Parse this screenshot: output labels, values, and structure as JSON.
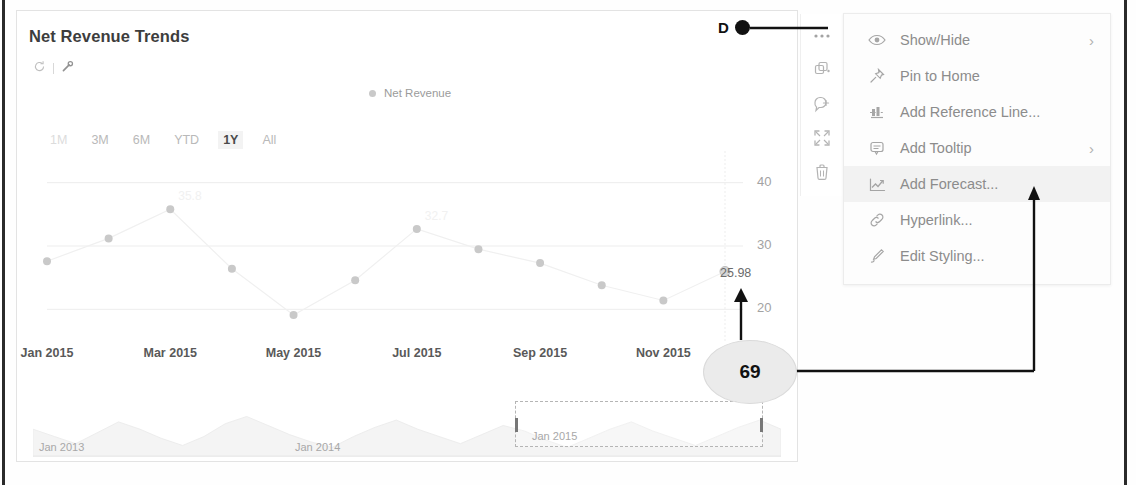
{
  "card": {
    "title": "Net Revenue Trends",
    "header_icons": [
      {
        "name": "refresh-icon",
        "label": "Refresh"
      },
      {
        "name": "wrench-icon",
        "label": "Configure"
      }
    ],
    "legend": [
      {
        "label": "Net Revenue",
        "color": "#c9c9c9"
      }
    ],
    "range_buttons": [
      {
        "label": "1M",
        "selected": false,
        "dim": true
      },
      {
        "label": "3M",
        "selected": false,
        "dim": false
      },
      {
        "label": "6M",
        "selected": false,
        "dim": false
      },
      {
        "label": "YTD",
        "selected": false,
        "dim": false
      },
      {
        "label": "1Y",
        "selected": true,
        "dim": false
      },
      {
        "label": "All",
        "selected": false,
        "dim": false
      }
    ],
    "point_label": "25.98"
  },
  "navigator": {
    "labels": [
      "Jan 2013",
      "Jan 2014",
      "Jan 2015"
    ],
    "selection_start_label": "Jan 2015"
  },
  "tool_strip": [
    {
      "name": "more-options-icon",
      "label": "More options"
    },
    {
      "name": "duplicate-icon",
      "label": "Duplicate"
    },
    {
      "name": "add-comment-icon",
      "label": "Add comment"
    },
    {
      "name": "expand-icon",
      "label": "Expand"
    },
    {
      "name": "delete-icon",
      "label": "Delete"
    }
  ],
  "context_menu": {
    "items": [
      {
        "label": "Show/Hide",
        "icon": "eye-icon",
        "submenu": true,
        "highlight": false
      },
      {
        "label": "Pin to Home",
        "icon": "pin-icon",
        "submenu": false,
        "highlight": false
      },
      {
        "label": "Add Reference Line...",
        "icon": "reference-line-icon",
        "submenu": false,
        "highlight": false
      },
      {
        "label": "Add Tooltip",
        "icon": "tooltip-icon",
        "submenu": true,
        "highlight": false
      },
      {
        "label": "Add Forecast...",
        "icon": "forecast-chart-icon",
        "submenu": false,
        "highlight": true
      },
      {
        "label": "Hyperlink...",
        "icon": "link-icon",
        "submenu": false,
        "highlight": false
      },
      {
        "label": "Edit Styling...",
        "icon": "brush-icon",
        "submenu": false,
        "highlight": false
      }
    ],
    "chevron_glyph": "›"
  },
  "annotations": {
    "marker_letter": "D",
    "callout_number": "69"
  },
  "colors": {
    "series": "#c9c9c9",
    "grid": "#ededed",
    "axis_text": "#a3a3a3",
    "highlight_row": "#f2f2f2",
    "annotation": "#111111"
  },
  "chart_data": {
    "type": "line",
    "title": "Net Revenue Trends",
    "xlabel": "",
    "ylabel": "",
    "ylim": [
      15,
      45
    ],
    "yticks": [
      20,
      30,
      40
    ],
    "grid": true,
    "legend": [
      "Net Revenue"
    ],
    "legend_position": "top-center",
    "xticks": [
      "Jan 2015",
      "Mar 2015",
      "May 2015",
      "Jul 2015",
      "Sep 2015",
      "Nov 2015"
    ],
    "x": [
      "Jan 2015",
      "Feb 2015",
      "Mar 2015",
      "Apr 2015",
      "May 2015",
      "Jun 2015",
      "Jul 2015",
      "Aug 2015",
      "Sep 2015",
      "Oct 2015",
      "Nov 2015",
      "Dec 2015"
    ],
    "series": [
      {
        "name": "Net Revenue",
        "values": [
          27.6,
          31.2,
          35.8,
          26.4,
          19.1,
          24.6,
          32.7,
          29.5,
          27.3,
          23.8,
          21.4,
          25.98
        ],
        "point_labels": [
          "",
          "",
          "35.8",
          "",
          "",
          "",
          "32.7",
          "",
          "",
          "",
          "",
          "25.98"
        ]
      }
    ],
    "annotations": [
      {
        "text": "25.98",
        "x": "Dec 2015",
        "y": 25.98
      }
    ]
  },
  "navigator_chart": {
    "type": "area",
    "xticks": [
      "Jan 2013",
      "Jan 2014",
      "Jan 2015"
    ],
    "selection": {
      "from": "Jan 2015",
      "to": "Dec 2015"
    }
  }
}
